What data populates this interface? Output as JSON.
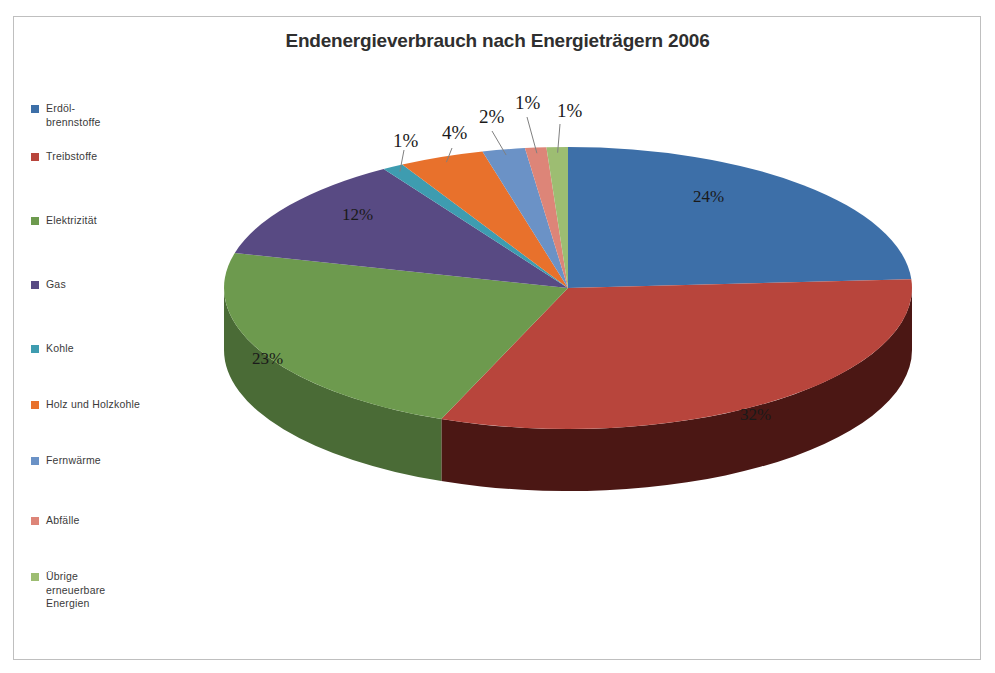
{
  "chart_data": {
    "type": "pie",
    "title": "Endenergieverbrauch nach Energieträgern 2006",
    "xlabel": "",
    "ylabel": "",
    "legend_position": "left",
    "grid": false,
    "three_d": true,
    "start_angle_deg": 0,
    "direction": "clockwise",
    "categories": [
      "Erdöl-\nbrennstoffe",
      "Treibstoffe",
      "Elektrizität",
      "Gas",
      "Kohle",
      "Holz und Holzkohle",
      "Fernwärme",
      "Abfälle",
      "Übrige\nerneuerbare\nEnergien"
    ],
    "values": [
      24,
      32,
      23,
      12,
      1,
      4,
      2,
      1,
      1
    ],
    "data_labels": [
      "24%",
      "32%",
      "23%",
      "12%",
      "1%",
      "4%",
      "2%",
      "1%",
      "1%"
    ],
    "colors": [
      "#3d6fa8",
      "#b8453c",
      "#6d9a4e",
      "#584a83",
      "#3e9cb0",
      "#e8712c",
      "#6b92c6",
      "#dd8578",
      "#9dbd72"
    ],
    "side_colors": [
      "#2a4f78",
      "#4b1714",
      "#4a6b36",
      "#3c325a",
      "#2b6d7b",
      "#a34d1e",
      "#4a6689",
      "#9b5d54",
      "#6e8450"
    ]
  },
  "legend": {
    "items": [
      {
        "label": "Erdöl-\nbrennstoffe",
        "color": "#3d6fa8",
        "top": 0
      },
      {
        "label": "Treibstoffe",
        "color": "#b8453c",
        "top": 48
      },
      {
        "label": "Elektrizität",
        "color": "#6d9a4e",
        "top": 112
      },
      {
        "label": "Gas",
        "color": "#584a83",
        "top": 176
      },
      {
        "label": "Kohle",
        "color": "#3e9cb0",
        "top": 240
      },
      {
        "label": "Holz und Holzkohle",
        "color": "#e8712c",
        "top": 296
      },
      {
        "label": "Fernwärme",
        "color": "#6b92c6",
        "top": 352
      },
      {
        "label": "Abfälle",
        "color": "#dd8578",
        "top": 412
      },
      {
        "label": "Übrige\nerneuerbare\nEnergien",
        "color": "#9dbd72",
        "top": 468
      }
    ]
  },
  "labels": {
    "erdoel": "24%",
    "treibstoffe": "32%",
    "elektrizitaet": "23%",
    "gas": "12%",
    "kohle": "1%",
    "holz": "4%",
    "fernwaerme": "2%",
    "abfaelle": "1%",
    "uebrige": "1%"
  }
}
